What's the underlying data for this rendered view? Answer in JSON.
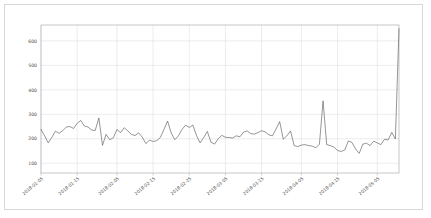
{
  "figure": {
    "background_color": "#ffffff",
    "border_color": "#d8d8d8",
    "plot_border_color": "#b0b0b0",
    "grid_color": "#d9d9d9",
    "line_color": "#555555"
  },
  "chart_data": {
    "type": "line",
    "title": "",
    "xlabel": "",
    "ylabel": "",
    "grid": true,
    "legend": "none",
    "ylim": [
      60,
      665
    ],
    "yticks": [
      100,
      200,
      300,
      400,
      500,
      600
    ],
    "ytick_labels": [
      "100",
      "200",
      "300",
      "400",
      "500",
      "600"
    ],
    "xtick_labels": [
      "2018-01-05",
      "2018-01-15",
      "2018-02-05",
      "2018-02-15",
      "2018-02-25",
      "2018-03-05",
      "2018-03-15",
      "2018-04-05",
      "2018-04-15",
      "2018-05-05"
    ],
    "xtick_positions": [
      0,
      10,
      21,
      31,
      41,
      51,
      61,
      72,
      82,
      93
    ],
    "x_range": [
      "2018-01-05",
      "2018-05-05"
    ],
    "series": [
      {
        "name": "value",
        "values": [
          238,
          212,
          183,
          206,
          231,
          222,
          233,
          248,
          250,
          242,
          263,
          275,
          252,
          248,
          236,
          234,
          285,
          173,
          218,
          196,
          204,
          238,
          225,
          245,
          232,
          218,
          213,
          224,
          207,
          180,
          194,
          189,
          192,
          205,
          238,
          272,
          224,
          196,
          212,
          238,
          256,
          246,
          256,
          213,
          183,
          205,
          230,
          186,
          178,
          200,
          214,
          206,
          205,
          203,
          212,
          208,
          227,
          232,
          221,
          219,
          225,
          233,
          228,
          216,
          212,
          240,
          270,
          198,
          212,
          232,
          172,
          168,
          174,
          176,
          172,
          170,
          163,
          178,
          355,
          176,
          172,
          166,
          152,
          148,
          154,
          191,
          185,
          158,
          140,
          178,
          182,
          172,
          190,
          183,
          176,
          198,
          195,
          226,
          199,
          650
        ]
      }
    ]
  }
}
